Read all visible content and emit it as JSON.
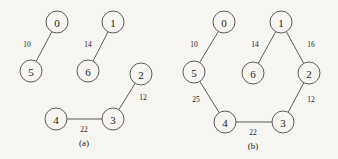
{
  "figure": {
    "background_color": "#f6f5f2",
    "stroke_color": "#5b5b5b",
    "text_color": "#1c1c1c"
  },
  "chart_data": {
    "type": "diagram",
    "title": "",
    "subtitle": "",
    "xlabel": "",
    "ylabel": "",
    "grid": false,
    "legend": "none",
    "panels": [
      {
        "id": "a",
        "caption": "(a)",
        "caption_pos": {
          "x": 84,
          "y": 143
        },
        "node_radius": 11,
        "nodes": [
          {
            "id": "0",
            "label": "0",
            "x": 57,
            "y": 22
          },
          {
            "id": "1",
            "label": "1",
            "x": 113,
            "y": 22
          },
          {
            "id": "2",
            "label": "2",
            "x": 141,
            "y": 74
          },
          {
            "id": "3",
            "label": "3",
            "x": 113,
            "y": 119
          },
          {
            "id": "4",
            "label": "4",
            "x": 56,
            "y": 119
          },
          {
            "id": "5",
            "label": "5",
            "x": 31,
            "y": 71
          },
          {
            "id": "6",
            "label": "6",
            "x": 88,
            "y": 71
          }
        ],
        "edges": [
          {
            "from": "0",
            "to": "5",
            "weight": "10",
            "label_x": 27,
            "label_y": 44
          },
          {
            "from": "1",
            "to": "6",
            "weight": "14",
            "label_x": 88,
            "label_y": 44
          },
          {
            "from": "2",
            "to": "3",
            "weight": "12",
            "label_x": 143,
            "label_y": 97
          },
          {
            "from": "3",
            "to": "4",
            "weight": "22",
            "label_x": 84,
            "label_y": 129
          }
        ]
      },
      {
        "id": "b",
        "caption": "(b)",
        "caption_pos": {
          "x": 253,
          "y": 146
        },
        "node_radius": 11,
        "nodes": [
          {
            "id": "0",
            "label": "0",
            "x": 224,
            "y": 22
          },
          {
            "id": "1",
            "label": "1",
            "x": 281,
            "y": 22
          },
          {
            "id": "2",
            "label": "2",
            "x": 309,
            "y": 73
          },
          {
            "id": "3",
            "label": "3",
            "x": 283,
            "y": 122
          },
          {
            "id": "4",
            "label": "4",
            "x": 225,
            "y": 122
          },
          {
            "id": "5",
            "label": "5",
            "x": 194,
            "y": 72
          },
          {
            "id": "6",
            "label": "6",
            "x": 253,
            "y": 73
          }
        ],
        "edges": [
          {
            "from": "0",
            "to": "5",
            "weight": "10",
            "label_x": 194,
            "label_y": 44
          },
          {
            "from": "1",
            "to": "6",
            "weight": "14",
            "label_x": 255,
            "label_y": 44
          },
          {
            "from": "1",
            "to": "2",
            "weight": "16",
            "label_x": 311,
            "label_y": 44
          },
          {
            "from": "5",
            "to": "4",
            "weight": "25",
            "label_x": 196,
            "label_y": 99
          },
          {
            "from": "2",
            "to": "3",
            "weight": "12",
            "label_x": 311,
            "label_y": 99
          },
          {
            "from": "3",
            "to": "4",
            "weight": "22",
            "label_x": 253,
            "label_y": 132
          }
        ]
      }
    ]
  }
}
